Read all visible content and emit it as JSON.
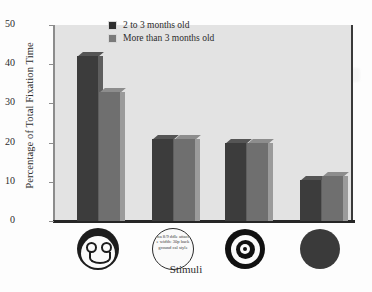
{
  "chart_data": {
    "type": "bar",
    "title": "",
    "xlabel": "Stimuli",
    "ylabel": "Percentage of Total Fixation Time",
    "categories": [
      "face",
      "scrambled-text-circle",
      "bullseye",
      "solid-disk"
    ],
    "category_labels": [
      "",
      "",
      "",
      ""
    ],
    "series": [
      {
        "name": "2 to 3 months old",
        "values": [
          42,
          21,
          20,
          10.5
        ],
        "color": "#3c3c3c"
      },
      {
        "name": "More than 3 months old",
        "values": [
          33,
          21,
          20,
          11.5
        ],
        "color": "#6f6f6f"
      }
    ],
    "ylim": [
      0,
      50
    ],
    "yticks": [
      0,
      10,
      20,
      30,
      40,
      50
    ],
    "grid": false,
    "legend_position": "top-center"
  },
  "axes": {
    "y_title": "Percentage of Total Fixation Time",
    "x_title": "Stimuli",
    "y_ticks": [
      "50",
      "40",
      "30",
      "20",
      "10",
      "0"
    ]
  },
  "legend": {
    "entries": [
      {
        "label": "2 to 3 months old",
        "swatch": "#2f2f2f"
      },
      {
        "label": "More than 3 months old",
        "swatch": "#7a7a7a"
      }
    ]
  },
  "stimuli": {
    "icons": [
      {
        "name": "schematic-face-icon",
        "caption": ""
      },
      {
        "name": "text-circle-icon",
        "caption": "ma 8/9 ddle attach e width: 30p background cal style"
      },
      {
        "name": "bullseye-icon",
        "caption": ""
      },
      {
        "name": "solid-disk-icon",
        "caption": ""
      }
    ]
  },
  "colors": {
    "plot_background": "#e3e3e3",
    "page_background": "#fdfdfd",
    "axis": "#262626",
    "series_1": "#3c3c3c",
    "series_2": "#6f6f6f"
  }
}
